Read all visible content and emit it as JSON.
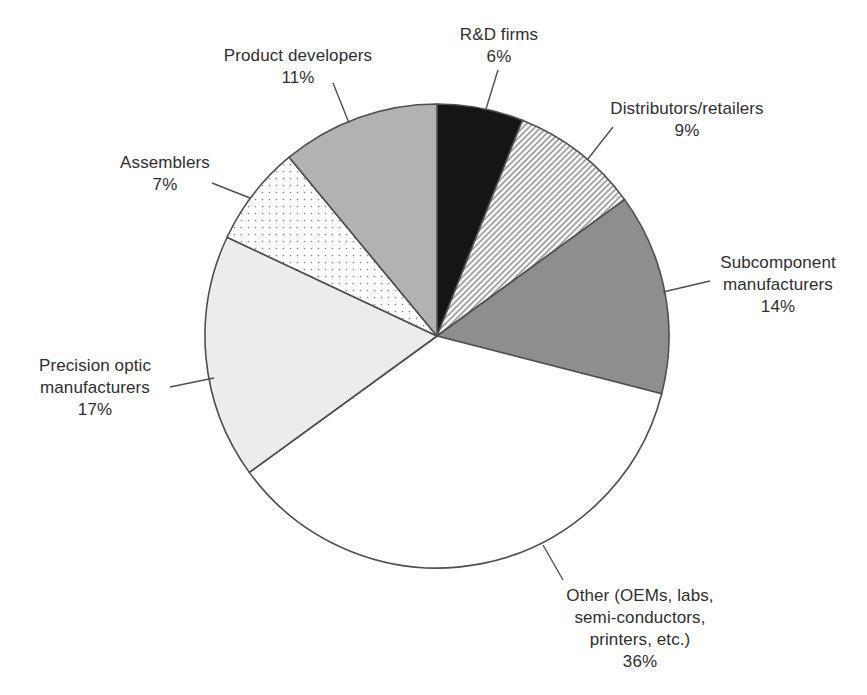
{
  "figure": {
    "background": "#ffffff",
    "text_color": "#2f2f2f",
    "outline_color": "#4f4f4f",
    "leader_color": "#4f4f4f"
  },
  "chart_data": {
    "type": "pie",
    "title": "",
    "start_angle_deg": 0,
    "direction": "clockwise",
    "legend_position": "outside-labels-with-leader-lines",
    "grid": false,
    "center": {
      "x": 437,
      "y": 336
    },
    "radius": 232,
    "categories": [
      "R&D firms",
      "Distributors/retailers",
      "Subcomponent manufacturers",
      "Other (OEMs, labs, semi-conductors, printers, etc.)",
      "Precision optic manufacturers",
      "Assemblers",
      "Product developers"
    ],
    "values": [
      6,
      9,
      14,
      36,
      17,
      7,
      11
    ],
    "slices": [
      {
        "label": "R&D firms",
        "value_pct": 6,
        "fill": "#151515",
        "pattern": "solid",
        "label_lines": [
          "R&D firms",
          "6%"
        ],
        "label_anchor": {
          "x": 499,
          "y": 24,
          "align": "center"
        },
        "leader_line": {
          "x1": 498,
          "y1": 70,
          "x2": 486,
          "y2": 109
        }
      },
      {
        "label": "Distributors/retailers",
        "value_pct": 9,
        "fill": "#ffffff",
        "pattern": "diagonal-hatch",
        "pattern_color": "#8f8f8f",
        "label_lines": [
          "Distributors/retailers",
          "9%"
        ],
        "label_anchor": {
          "x": 687,
          "y": 98,
          "align": "center"
        },
        "leader_line": {
          "x1": 613,
          "y1": 127,
          "x2": 587,
          "y2": 160
        }
      },
      {
        "label": "Subcomponent manufacturers",
        "value_pct": 14,
        "fill": "#8e8e8e",
        "pattern": "solid",
        "label_lines": [
          "Subcomponent",
          "manufacturers",
          "14%"
        ],
        "label_anchor": {
          "x": 778,
          "y": 252,
          "align": "center"
        },
        "leader_line": {
          "x1": 710,
          "y1": 281,
          "x2": 663,
          "y2": 292
        }
      },
      {
        "label": "Other (OEMs, labs, semi-conductors, printers, etc.)",
        "value_pct": 36,
        "fill": "#ffffff",
        "pattern": "solid",
        "label_lines": [
          "Other (OEMs, labs,",
          "semi-conductors,",
          "printers, etc.)",
          "36%"
        ],
        "label_anchor": {
          "x": 640,
          "y": 585,
          "align": "center"
        },
        "leader_line": {
          "x1": 563,
          "y1": 580,
          "x2": 543,
          "y2": 545
        }
      },
      {
        "label": "Precision optic manufacturers",
        "value_pct": 17,
        "fill": "#ececec",
        "pattern": "solid",
        "label_lines": [
          "Precision optic",
          "manufacturers",
          "17%"
        ],
        "label_anchor": {
          "x": 95,
          "y": 355,
          "align": "center"
        },
        "leader_line": {
          "x1": 170,
          "y1": 387,
          "x2": 214,
          "y2": 378
        }
      },
      {
        "label": "Assemblers",
        "value_pct": 7,
        "fill": "#ffffff",
        "pattern": "dots",
        "pattern_color": "#8a8a8a",
        "label_lines": [
          "Assemblers",
          "7%"
        ],
        "label_anchor": {
          "x": 165,
          "y": 152,
          "align": "center"
        },
        "leader_line": {
          "x1": 212,
          "y1": 183,
          "x2": 250,
          "y2": 198
        }
      },
      {
        "label": "Product developers",
        "value_pct": 11,
        "fill": "#b2b2b2",
        "pattern": "solid",
        "label_lines": [
          "Product developers",
          "11%"
        ],
        "label_anchor": {
          "x": 298,
          "y": 45,
          "align": "center"
        },
        "leader_line": {
          "x1": 333,
          "y1": 83,
          "x2": 349,
          "y2": 123
        }
      }
    ]
  }
}
